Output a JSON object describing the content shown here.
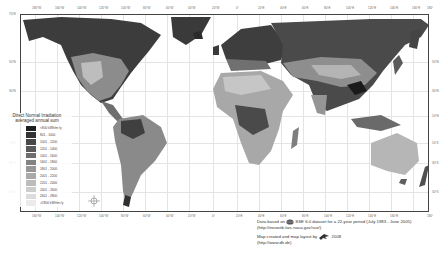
{
  "map": {
    "title": "Direct Normal Irradiation averaged annual sum",
    "longitude_ticks_top": [
      "180°W",
      "160°W",
      "140°W",
      "120°W",
      "100°W",
      "80°W",
      "60°W",
      "40°W",
      "20°W",
      "0°",
      "20°E",
      "40°E",
      "60°E",
      "80°E",
      "100°E",
      "120°E",
      "140°E",
      "160°E",
      "180°"
    ],
    "longitude_ticks_bottom": [
      "160°W",
      "140°W",
      "120°W",
      "100°W",
      "80°W",
      "60°W",
      "40°W",
      "20°W",
      "0°",
      "20°E",
      "40°E",
      "60°E",
      "80°E",
      "100°E",
      "120°E",
      "140°E",
      "160°E",
      "180°"
    ],
    "latitude_ticks_left": [
      "70°N",
      "50°N",
      "30°N",
      "10°N",
      "10°S",
      "30°S",
      "50°S"
    ],
    "latitude_ticks_right": [
      "50°N",
      "30°N",
      "10°N",
      "10°S",
      "30°S",
      "50°S"
    ]
  },
  "legend": {
    "title_line1": "Direct Normal Irradiation",
    "title_line2": "averaged annual sum",
    "items": [
      {
        "label": "<800 kWh/m²/y",
        "color": "#1e1e1e"
      },
      {
        "label": "801 - 1000",
        "color": "#333333"
      },
      {
        "label": "1001 - 1200",
        "color": "#474747"
      },
      {
        "label": "1201 - 1400",
        "color": "#5a5a5a"
      },
      {
        "label": "1401 - 1600",
        "color": "#6e6e6e"
      },
      {
        "label": "1601 - 1800",
        "color": "#828282"
      },
      {
        "label": "1801 - 2000",
        "color": "#969696"
      },
      {
        "label": "2001 - 2200",
        "color": "#a9a9a9"
      },
      {
        "label": "2201 - 2400",
        "color": "#bcbcbc"
      },
      {
        "label": "2401 - 2600",
        "color": "#cdcdcd"
      },
      {
        "label": "2601 - 2800",
        "color": "#dcdcdc"
      },
      {
        "label": ">2800 kWh/m²/y",
        "color": "#ebebeb"
      }
    ]
  },
  "credits": {
    "data_prefix": "Data based on",
    "data_suffix": "SSE 6.0 dataset for a 22-year period (July 1983 - June 2005)",
    "data_url": "(http://eosweb.larc.nasa.gov/sse/)",
    "map_prefix": "Map created and map layout by",
    "map_year": "2008",
    "map_url": "(http://www.dlr.de)"
  }
}
